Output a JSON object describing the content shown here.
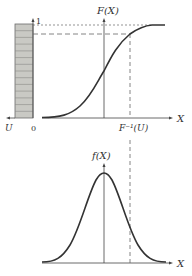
{
  "top_plot": {
    "y_axis_label": "F(X)",
    "x_axis_label": "X",
    "uniform_axis_label": "U",
    "origin_label": "0",
    "top_tick_label": "1",
    "inverse_label": "F⁻¹(U)",
    "bar_segments": 14
  },
  "bottom_plot": {
    "y_axis_label": "f(X)",
    "x_axis_label": "X"
  },
  "colors": {
    "curve": "#333333",
    "bar_fill": "#c9c9c4",
    "bar_line": "#6b6b6b",
    "dashed": "#666666"
  }
}
